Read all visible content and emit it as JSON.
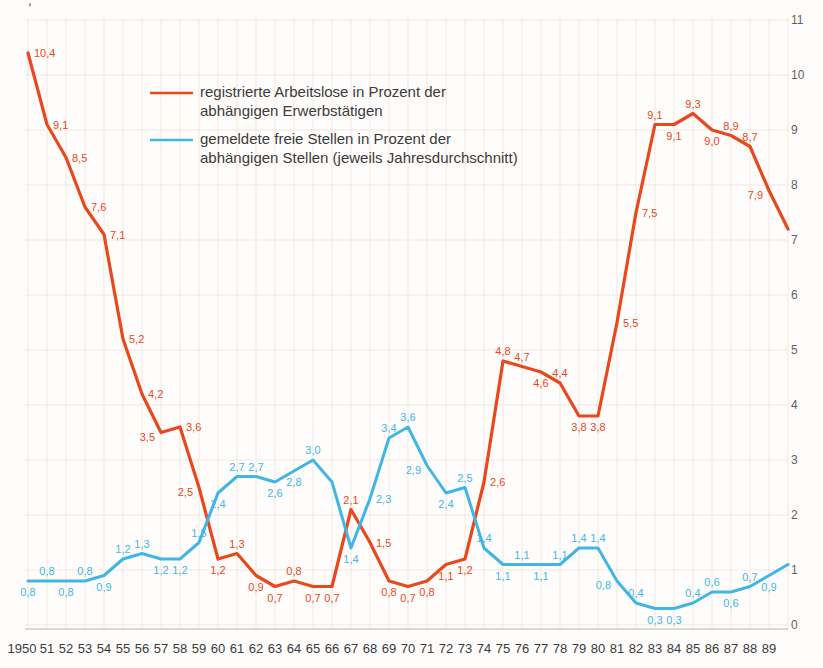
{
  "page": {
    "background": "#fefdfb",
    "corner_mark": ","
  },
  "legend": {
    "items": [
      {
        "color": "#e8481c",
        "line1": "registrierte Arbeitslose in Prozent der",
        "line2": "abhängigen Erwerbstätigen"
      },
      {
        "color": "#41b6e6",
        "line1": "gemeldete freie Stellen in Prozent der",
        "line2": "abhängigen Stellen (jeweils Jahresdurchschnitt)"
      }
    ]
  },
  "chart_data": {
    "type": "line",
    "title": "",
    "xlabel": "",
    "ylabel": "",
    "ylim": [
      0,
      11
    ],
    "grid": true,
    "legend_position": "top-left-inside",
    "y_ticks": [
      "0",
      "1",
      "2",
      "3",
      "4",
      "5",
      "6",
      "7",
      "8",
      "9",
      "10",
      "11"
    ],
    "x_tick_labels": [
      "1950",
      "51",
      "52",
      "53",
      "54",
      "55",
      "56",
      "57",
      "58",
      "59",
      "60",
      "61",
      "62",
      "63",
      "64",
      "65",
      "66",
      "67",
      "68",
      "69",
      "70",
      "71",
      "72",
      "73",
      "74",
      "75",
      "76",
      "77",
      "78",
      "79",
      "80",
      "81",
      "82",
      "83",
      "84",
      "85",
      "86",
      "87",
      "88",
      "89"
    ],
    "series": [
      {
        "name": "registrierte Arbeitslose in Prozent der abhängigen Erwerbstätigen",
        "color": "#e8481c",
        "points": [
          {
            "v": 10.4,
            "label": "10,4",
            "side": "right"
          },
          {
            "v": 9.1,
            "label": "9,1",
            "side": "right"
          },
          {
            "v": 8.5,
            "label": "8,5",
            "side": "right"
          },
          {
            "v": 7.6,
            "label": "7,6",
            "side": "right"
          },
          {
            "v": 7.1,
            "label": "7,1",
            "side": "right"
          },
          {
            "v": 5.2,
            "label": "5,2",
            "side": "right"
          },
          {
            "v": 4.2,
            "label": "4,2",
            "side": "right"
          },
          {
            "v": 3.5,
            "label": "3,5",
            "side": "left"
          },
          {
            "v": 3.6,
            "label": "3,6",
            "side": "right"
          },
          {
            "v": 2.5,
            "label": "2,5",
            "side": "left"
          },
          {
            "v": 1.2,
            "label": "1,2",
            "side": "below"
          },
          {
            "v": 1.3,
            "label": "1,3",
            "side": "above"
          },
          {
            "v": 0.9,
            "label": "0,9",
            "side": "below"
          },
          {
            "v": 0.7,
            "label": "0,7",
            "side": "below"
          },
          {
            "v": 0.8,
            "label": "0,8",
            "side": "above"
          },
          {
            "v": 0.7,
            "label": "0,7",
            "side": "below"
          },
          {
            "v": 0.7,
            "label": "0,7",
            "side": "below"
          },
          {
            "v": 2.1,
            "label": "2,1",
            "side": "above"
          },
          {
            "v": 1.5,
            "label": "1,5",
            "side": "right"
          },
          {
            "v": 0.8,
            "label": "0,8",
            "side": "below"
          },
          {
            "v": 0.7,
            "label": "0,7",
            "side": "below"
          },
          {
            "v": 0.8,
            "label": "0,8",
            "side": "below"
          },
          {
            "v": 1.1,
            "label": "1,1",
            "side": "below"
          },
          {
            "v": 1.2,
            "label": "1,2",
            "side": "below"
          },
          {
            "v": 2.6,
            "label": "2,6",
            "side": "right"
          },
          {
            "v": 4.8,
            "label": "4,8",
            "side": "above"
          },
          {
            "v": 4.7,
            "label": "4,7",
            "side": "above"
          },
          {
            "v": 4.6,
            "label": "4,6",
            "side": "below"
          },
          {
            "v": 4.4,
            "label": "4,4",
            "side": "above"
          },
          {
            "v": 3.8,
            "label": "3,8",
            "side": "below"
          },
          {
            "v": 3.8,
            "label": "3,8",
            "side": "below"
          },
          {
            "v": 5.5,
            "label": "5,5",
            "side": "right"
          },
          {
            "v": 7.5,
            "label": "7,5",
            "side": "right"
          },
          {
            "v": 9.1,
            "label": "9,1",
            "side": "above"
          },
          {
            "v": 9.1,
            "label": "9,1",
            "side": "below"
          },
          {
            "v": 9.3,
            "label": "9,3",
            "side": "above"
          },
          {
            "v": 9.0,
            "label": "9,0",
            "side": "below"
          },
          {
            "v": 8.9,
            "label": "8,9",
            "side": "above"
          },
          {
            "v": 8.7,
            "label": "8,7",
            "side": "above"
          },
          {
            "v": 7.9,
            "label": "7,9",
            "side": "left"
          },
          {
            "v": 7.2,
            "label": "",
            "side": "above"
          }
        ]
      },
      {
        "name": "gemeldete freie Stellen in Prozent der abhängigen Stellen (jeweils Jahresdurchschnitt)",
        "color": "#41b6e6",
        "points": [
          {
            "v": 0.8,
            "label": "0,8",
            "side": "below"
          },
          {
            "v": 0.8,
            "label": "0,8",
            "side": "above"
          },
          {
            "v": 0.8,
            "label": "0,8",
            "side": "below"
          },
          {
            "v": 0.8,
            "label": "0,8",
            "side": "above"
          },
          {
            "v": 0.9,
            "label": "0,9",
            "side": "below"
          },
          {
            "v": 1.2,
            "label": "1,2",
            "side": "above"
          },
          {
            "v": 1.3,
            "label": "1,3",
            "side": "above"
          },
          {
            "v": 1.2,
            "label": "1,2",
            "side": "below"
          },
          {
            "v": 1.2,
            "label": "1,2",
            "side": "below"
          },
          {
            "v": 1.5,
            "label": "1,5",
            "side": "above"
          },
          {
            "v": 2.4,
            "label": "2,4",
            "side": "below"
          },
          {
            "v": 2.7,
            "label": "2,7",
            "side": "above"
          },
          {
            "v": 2.7,
            "label": "2,7",
            "side": "above"
          },
          {
            "v": 2.6,
            "label": "2,6",
            "side": "below"
          },
          {
            "v": 2.8,
            "label": "2,8",
            "side": "below"
          },
          {
            "v": 3.0,
            "label": "3,0",
            "side": "above"
          },
          {
            "v": 2.6,
            "label": "",
            "side": "above"
          },
          {
            "v": 1.4,
            "label": "1,4",
            "side": "below"
          },
          {
            "v": 2.3,
            "label": "2,3",
            "side": "right"
          },
          {
            "v": 3.4,
            "label": "3,4",
            "side": "above"
          },
          {
            "v": 3.6,
            "label": "3,6",
            "side": "above"
          },
          {
            "v": 2.9,
            "label": "2,9",
            "side": "left"
          },
          {
            "v": 2.4,
            "label": "2,4",
            "side": "below"
          },
          {
            "v": 2.5,
            "label": "2,5",
            "side": "above"
          },
          {
            "v": 1.4,
            "label": "1,4",
            "side": "above"
          },
          {
            "v": 1.1,
            "label": "1,1",
            "side": "below"
          },
          {
            "v": 1.1,
            "label": "1,1",
            "side": "above"
          },
          {
            "v": 1.1,
            "label": "1,1",
            "side": "below"
          },
          {
            "v": 1.1,
            "label": "1,1",
            "side": "above"
          },
          {
            "v": 1.4,
            "label": "1,4",
            "side": "above"
          },
          {
            "v": 1.4,
            "label": "1,4",
            "side": "above"
          },
          {
            "v": 0.8,
            "label": "0,8",
            "side": "left"
          },
          {
            "v": 0.4,
            "label": "0,4",
            "side": "above"
          },
          {
            "v": 0.3,
            "label": "0,3",
            "side": "below"
          },
          {
            "v": 0.3,
            "label": "0,3",
            "side": "below"
          },
          {
            "v": 0.4,
            "label": "0,4",
            "side": "above"
          },
          {
            "v": 0.6,
            "label": "0,6",
            "side": "above"
          },
          {
            "v": 0.6,
            "label": "0,6",
            "side": "below"
          },
          {
            "v": 0.7,
            "label": "0,7",
            "side": "above"
          },
          {
            "v": 0.9,
            "label": "0,9",
            "side": "below"
          },
          {
            "v": 1.1,
            "label": "",
            "side": "above"
          }
        ]
      }
    ]
  }
}
